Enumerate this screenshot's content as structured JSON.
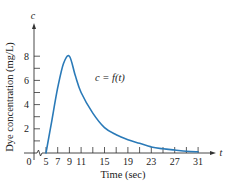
{
  "chart_data": {
    "type": "line",
    "title": "",
    "curve_label": "c = f(t)",
    "xlabel": "Time (sec)",
    "ylabel": "Dye concentration (mg/L)",
    "x_axis_symbol": "t",
    "y_axis_symbol": "c",
    "origin_label": "0",
    "x_ticks": [
      5,
      7,
      9,
      11,
      13,
      15,
      17,
      19,
      21,
      23,
      25,
      27,
      29,
      31
    ],
    "x_tick_labels": [
      "5",
      "7",
      "9",
      "11",
      "15",
      "19",
      "23",
      "27",
      "31"
    ],
    "y_ticks": [
      1,
      2,
      3,
      4,
      5,
      6,
      7,
      8
    ],
    "y_tick_labels": [
      "2",
      "4",
      "6",
      "8"
    ],
    "xlim": [
      5,
      31
    ],
    "ylim": [
      0,
      9
    ],
    "grid": false,
    "legend": "none",
    "axis_break": true,
    "series": [
      {
        "name": "c = f(t)",
        "color": "#2a7ab8",
        "x": [
          5,
          6,
          7,
          8,
          9,
          10,
          11,
          13,
          15,
          17,
          19,
          21,
          23,
          25,
          27,
          29,
          31
        ],
        "y": [
          0,
          2.7,
          5.4,
          7.4,
          8.0,
          6.4,
          5.0,
          3.3,
          2.1,
          1.5,
          1.1,
          0.8,
          0.5,
          0.35,
          0.25,
          0.15,
          0.1
        ]
      }
    ]
  },
  "colors": {
    "curve": "#2a7ab8",
    "axis": "#333333",
    "text": "#222222"
  }
}
